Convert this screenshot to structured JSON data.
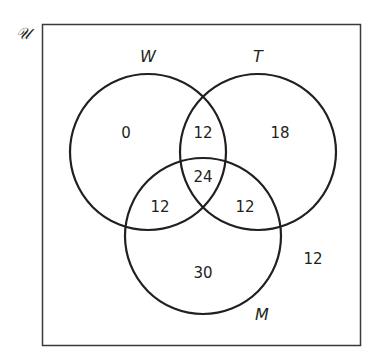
{
  "diagram": {
    "type": "venn",
    "universal_set_label": "𝒰",
    "sets": [
      {
        "id": "W",
        "label": "W"
      },
      {
        "id": "T",
        "label": "T"
      },
      {
        "id": "M",
        "label": "M"
      }
    ],
    "regions": {
      "W_only": "0",
      "T_only": "18",
      "M_only": "30",
      "W_and_T_only": "12",
      "W_and_M_only": "12",
      "T_and_M_only": "12",
      "W_and_T_and_M": "24",
      "outside": "12"
    },
    "colors": {
      "stroke": "#231f20",
      "border": "#3a3a3a",
      "background": "#ffffff"
    }
  }
}
